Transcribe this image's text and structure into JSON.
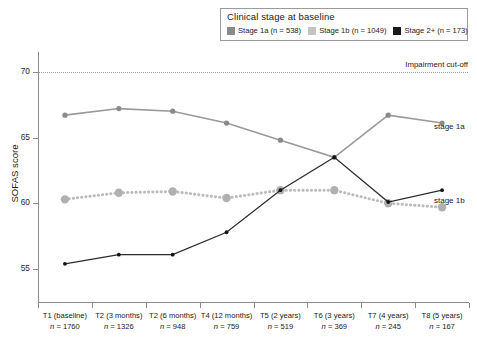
{
  "legend": {
    "title": "Clinical stage at baseline",
    "items": [
      {
        "label": "Stage 1a (n = 538)",
        "color": "#8a8a8a",
        "series": "stage_1a"
      },
      {
        "label": "Stage 1b (n = 1049)",
        "color": "#c4c4c4",
        "series": "stage_1b"
      },
      {
        "label": "Stage 2+ (n = 173)",
        "color": "#1a1a1a",
        "series": "stage_2plus"
      }
    ]
  },
  "annotations": {
    "cutoff_label": "Impairment cut-off",
    "cutoff_value": 69,
    "series_label_1a": "stage 1a",
    "series_label_1b": "stage 1b"
  },
  "axes": {
    "ylabel": "SOFAS score",
    "yticks": [
      70,
      65,
      60,
      55
    ],
    "ytick_labels": [
      "70",
      "65",
      "60",
      "55"
    ],
    "ylim": [
      52.5,
      71.5
    ],
    "xlabel": ""
  },
  "chart_data": {
    "type": "line",
    "title": "",
    "xlabel": "",
    "ylabel": "SOFAS score",
    "ylim": [
      52.5,
      71.5
    ],
    "grid": false,
    "legend_position": "top-right",
    "categories": [
      "T1 (baseline)",
      "T2 (3 months)",
      "T2 (6 months)",
      "T4 (12 months)",
      "T5 (2 years)",
      "T6 (3 years)",
      "T7 (4 years)",
      "T8 (5 years)"
    ],
    "category_n": [
      "n = 1760",
      "n = 1326",
      "n = 948",
      "n = 759",
      "n = 519",
      "n = 369",
      "n = 245",
      "n = 167"
    ],
    "series": [
      {
        "name": "Stage 1a (n = 538)",
        "short_name": "stage 1a",
        "n": 538,
        "color": "#8a8a8a",
        "linestyle": "solid",
        "values": [
          66.7,
          67.2,
          67.0,
          66.1,
          64.8,
          63.5,
          66.7,
          66.1
        ]
      },
      {
        "name": "Stage 1b (n = 1049)",
        "short_name": "stage 1b",
        "n": 1049,
        "color": "#b0b0b0",
        "linestyle": "dotted",
        "values": [
          60.3,
          60.8,
          60.9,
          60.4,
          61.0,
          61.0,
          60.0,
          59.7
        ]
      },
      {
        "name": "Stage 2+ (n = 173)",
        "short_name": "stage 2+",
        "n": 173,
        "color": "#1a1a1a",
        "linestyle": "solid",
        "values": [
          55.4,
          56.1,
          56.1,
          57.8,
          61.0,
          63.5,
          60.1,
          61.0
        ]
      }
    ],
    "reference_lines": [
      {
        "label": "Impairment cut-off",
        "y": 69,
        "style": "dotted"
      }
    ]
  }
}
